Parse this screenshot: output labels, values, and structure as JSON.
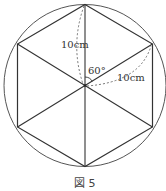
{
  "figure": {
    "caption": "図 5",
    "shape": "regular hexagon inscribed in circle",
    "labels": {
      "radius_upper": "10cm",
      "radius_right": "10cm",
      "angle": "60°"
    },
    "colors": {
      "stroke": "#444444",
      "dashed": "#666666",
      "background": "#ffffff"
    }
  }
}
